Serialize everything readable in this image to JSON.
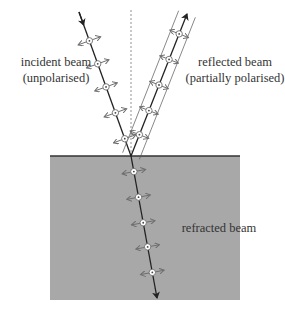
{
  "diagram": {
    "labels": {
      "incident": [
        "incident beam",
        "(unpolarised)"
      ],
      "reflected": [
        "reflected beam",
        "(partially polarised)"
      ],
      "refracted": "refracted beam"
    },
    "colors": {
      "medium_fill": "#a8a8a8",
      "surface_line": "#333333",
      "beam": "#222222",
      "polarisation_arrow": "#6e6e6e",
      "normal_line": "#777777",
      "background": "#ffffff"
    },
    "geometry": {
      "surface_y": 156,
      "medium": {
        "x": 50,
        "y": 156,
        "width": 190,
        "height": 144
      },
      "point_of_incidence": [
        131,
        156
      ],
      "incident_start": [
        79,
        12
      ],
      "reflected_end": [
        187,
        14
      ],
      "refracted_end": [
        157,
        298
      ],
      "normal_top_y": 10
    },
    "markers": {
      "incident": [
        0.2,
        0.36,
        0.52,
        0.7,
        0.88
      ],
      "reflected": [
        0.15,
        0.32,
        0.5,
        0.68,
        0.86
      ],
      "refracted": [
        0.11,
        0.29,
        0.47,
        0.64,
        0.82
      ]
    }
  }
}
